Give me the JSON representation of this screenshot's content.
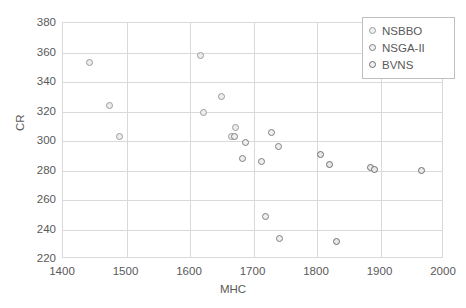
{
  "chart_data": {
    "type": "scatter",
    "title": "",
    "xlabel": "MHC",
    "ylabel": "CR",
    "xlim": [
      1400,
      2000
    ],
    "ylim": [
      220,
      380
    ],
    "xticks": [
      1400,
      1500,
      1600,
      1700,
      1800,
      1900,
      2000
    ],
    "yticks": [
      220,
      240,
      260,
      280,
      300,
      320,
      340,
      360,
      380
    ],
    "grid": true,
    "legend_position": "top-right",
    "legend_entries": [
      "NSBBO",
      "NSGA-II",
      "BVNS"
    ],
    "series": [
      {
        "name": "NSBBO",
        "marker": "open-circle",
        "color": "#9b9b9b",
        "points": [
          {
            "x": 1442,
            "y": 353
          },
          {
            "x": 1473,
            "y": 324
          },
          {
            "x": 1489,
            "y": 303
          },
          {
            "x": 1617,
            "y": 358
          },
          {
            "x": 1622,
            "y": 319
          },
          {
            "x": 1650,
            "y": 330
          },
          {
            "x": 1665,
            "y": 303
          },
          {
            "x": 1672,
            "y": 309
          }
        ]
      },
      {
        "name": "NSGA-II",
        "marker": "open-circle",
        "color": "#7f7f7f",
        "points": [
          {
            "x": 1670,
            "y": 303
          },
          {
            "x": 1682,
            "y": 288
          },
          {
            "x": 1688,
            "y": 299
          },
          {
            "x": 1713,
            "y": 286
          },
          {
            "x": 1729,
            "y": 306
          },
          {
            "x": 1740,
            "y": 296
          },
          {
            "x": 1719,
            "y": 249
          },
          {
            "x": 1741,
            "y": 234
          }
        ]
      },
      {
        "name": "BVNS",
        "marker": "open-circle",
        "color": "#6e6e6e",
        "points": [
          {
            "x": 1805,
            "y": 291
          },
          {
            "x": 1820,
            "y": 284
          },
          {
            "x": 1830,
            "y": 232
          },
          {
            "x": 1884,
            "y": 282
          },
          {
            "x": 1891,
            "y": 281
          },
          {
            "x": 1965,
            "y": 280
          }
        ]
      }
    ]
  },
  "axes": {
    "x_title": "MHC",
    "y_title": "CR",
    "x_tick_labels": [
      "1400",
      "1500",
      "1600",
      "1700",
      "1800",
      "1900",
      "2000"
    ],
    "y_tick_labels": [
      "380",
      "360",
      "340",
      "320",
      "300",
      "280",
      "260",
      "240",
      "220"
    ]
  },
  "legend": {
    "items": [
      {
        "label": "NSBBO",
        "marker": "circle-icon",
        "color": "#9b9b9b"
      },
      {
        "label": "NSGA-II",
        "marker": "circle-icon",
        "color": "#7f7f7f"
      },
      {
        "label": "BVNS",
        "marker": "circle-icon",
        "color": "#6e6e6e"
      }
    ]
  }
}
